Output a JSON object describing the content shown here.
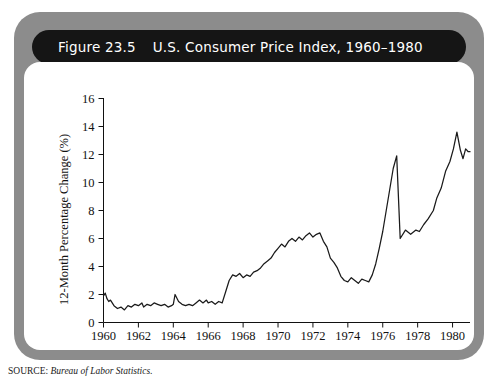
{
  "figure": {
    "number_label": "Figure 23.5",
    "title": "U.S. Consumer Price Index, 1960–1980",
    "source": {
      "label": "SOURCE:",
      "text": " Bureau of Labor Statistics."
    },
    "frame_color": "#8c8c8c",
    "title_bar_color": "#151515",
    "panel_color": "#ffffff",
    "line_color": "#1a1a1a"
  },
  "chart_data": {
    "type": "line",
    "title": "U.S. Consumer Price Index, 1960–1980",
    "xlabel": "",
    "ylabel": "12-Month Percentage Change (%)",
    "xlim": [
      1960,
      1981
    ],
    "ylim": [
      0,
      16
    ],
    "ytick_step": 2,
    "xtick_step": 2,
    "grid": false,
    "legend": "none",
    "yticks": [
      0,
      2,
      4,
      6,
      8,
      10,
      12,
      14,
      16
    ],
    "ytick_labels": [
      "0",
      "2",
      "4",
      "6",
      "8",
      "10",
      "12",
      "14",
      "16"
    ],
    "xticks": [
      1960,
      1962,
      1964,
      1966,
      1968,
      1970,
      1972,
      1974,
      1976,
      1978,
      1980
    ],
    "xtick_labels": [
      "1960",
      "1962",
      "1964",
      "1966",
      "1968",
      "1970",
      "1972",
      "1974",
      "1976",
      "1978",
      "1980"
    ],
    "series": [
      {
        "name": "12-Month Percentage Change in CPI",
        "x": [
          1960.0,
          1960.1,
          1960.2,
          1960.3,
          1960.4,
          1960.5,
          1960.6,
          1960.8,
          1961.0,
          1961.2,
          1961.4,
          1961.6,
          1961.8,
          1962.0,
          1962.2,
          1962.3,
          1962.5,
          1962.7,
          1962.9,
          1963.1,
          1963.3,
          1963.5,
          1963.7,
          1963.9,
          1964.0,
          1964.1,
          1964.3,
          1964.5,
          1964.7,
          1964.9,
          1965.1,
          1965.3,
          1965.5,
          1965.7,
          1965.9,
          1966.0,
          1966.2,
          1966.4,
          1966.6,
          1966.8,
          1967.0,
          1967.2,
          1967.4,
          1967.6,
          1967.8,
          1968.0,
          1968.2,
          1968.4,
          1968.6,
          1968.8,
          1969.0,
          1969.2,
          1969.4,
          1969.6,
          1969.8,
          1970.0,
          1970.2,
          1970.4,
          1970.6,
          1970.8,
          1971.0,
          1971.2,
          1971.4,
          1971.6,
          1971.8,
          1972.0,
          1972.2,
          1972.4,
          1972.6,
          1972.8,
          1973.0,
          1973.2,
          1973.4,
          1973.6,
          1973.8,
          1974.0,
          1974.2,
          1974.4,
          1974.6,
          1974.8,
          1975.0,
          1975.2,
          1975.4,
          1975.6,
          1975.8,
          1976.0,
          1976.2,
          1976.4,
          1976.6,
          1976.8,
          1977.0,
          1977.2,
          1977.4,
          1977.6,
          1977.8,
          1978.0,
          1978.2,
          1978.4,
          1978.6,
          1978.8,
          1979.0,
          1979.2,
          1979.4,
          1979.6,
          1979.8,
          1980.0,
          1980.2,
          1980.35,
          1980.5,
          1980.65,
          1980.8,
          1980.95
        ],
        "values": [
          1.9,
          2.1,
          1.7,
          1.5,
          1.6,
          1.4,
          1.2,
          1.0,
          1.1,
          0.9,
          1.2,
          1.1,
          1.3,
          1.2,
          1.4,
          1.1,
          1.3,
          1.2,
          1.4,
          1.3,
          1.2,
          1.3,
          1.1,
          1.2,
          1.3,
          2.0,
          1.5,
          1.3,
          1.2,
          1.3,
          1.2,
          1.4,
          1.6,
          1.4,
          1.6,
          1.4,
          1.5,
          1.3,
          1.5,
          1.4,
          2.2,
          3.0,
          3.4,
          3.3,
          3.5,
          3.2,
          3.4,
          3.3,
          3.6,
          3.7,
          3.9,
          4.2,
          4.4,
          4.6,
          5.0,
          5.3,
          5.6,
          5.4,
          5.8,
          6.0,
          5.8,
          6.1,
          5.9,
          6.2,
          6.4,
          6.1,
          6.3,
          6.4,
          5.8,
          5.4,
          4.6,
          4.3,
          3.9,
          3.3,
          3.0,
          2.9,
          3.2,
          3.0,
          2.8,
          3.1,
          3.0,
          2.9,
          3.4,
          4.2,
          5.3,
          6.5,
          8.0,
          9.5,
          11.0,
          11.9,
          11.2,
          10.0,
          8.7,
          7.6,
          6.9,
          6.4,
          6.2,
          6.0,
          6.3,
          6.1,
          5.9,
          6.2,
          6.0,
          5.8,
          6.1,
          6.4,
          6.2,
          6.0,
          6.6,
          7.5,
          8.9,
          9.0
        ]
      }
    ],
    "annotations": {
      "peak_1974": {
        "year": 1974.8,
        "value": 11.9
      },
      "peak_1980": {
        "year": 1980.25,
        "value": 13.6
      },
      "trough_1972": {
        "year": 1972.6,
        "value": 2.7
      },
      "final_value": {
        "year": 1981.0,
        "value": 12.2
      }
    },
    "series_tail": {
      "x": [
        1977.0,
        1977.3,
        1977.6,
        1977.9,
        1978.1,
        1978.35,
        1978.6,
        1978.9,
        1979.1,
        1979.35,
        1979.6,
        1979.85,
        1980.05,
        1980.25,
        1980.45,
        1980.6,
        1980.75,
        1980.9,
        1981.0
      ],
      "values": [
        6.0,
        6.6,
        6.3,
        6.6,
        6.5,
        7.0,
        7.4,
        8.0,
        8.9,
        9.6,
        10.8,
        11.5,
        12.4,
        13.6,
        12.3,
        11.7,
        12.4,
        12.2,
        12.2
      ]
    }
  }
}
